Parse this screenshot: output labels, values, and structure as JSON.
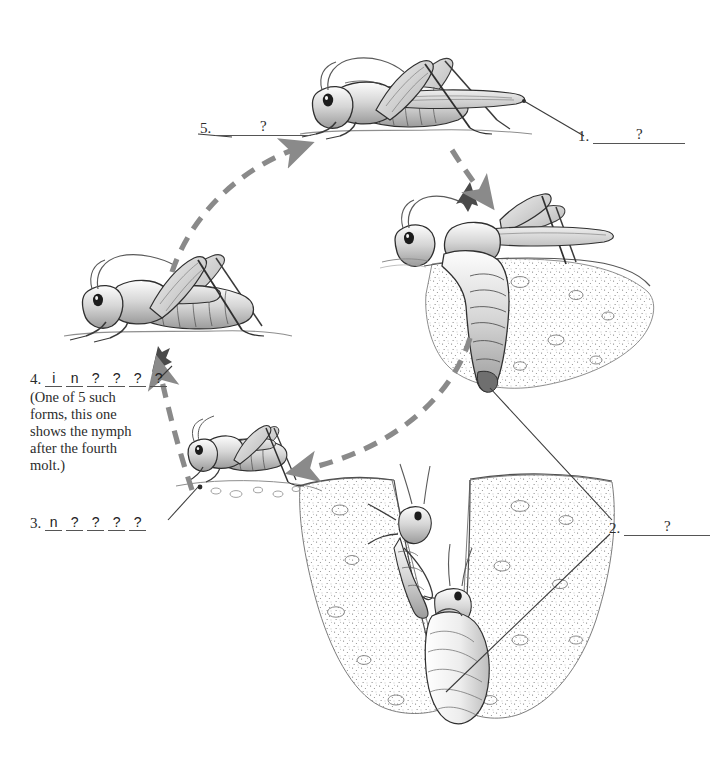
{
  "figure": {
    "background_color": "#ffffff",
    "ink_color": "#2b2b2b",
    "arrow_color": "#8a8a8a"
  },
  "labels": [
    {
      "id": "label-1",
      "number": "1.",
      "blank_type": "long",
      "answer_mark": "?",
      "note": ""
    },
    {
      "id": "label-2",
      "number": "2.",
      "blank_type": "long",
      "answer_mark": "?",
      "note": ""
    },
    {
      "id": "label-3",
      "number": "3.",
      "blank_type": "slots",
      "slots": [
        "n",
        "?",
        "?",
        "?",
        "?"
      ],
      "note": ""
    },
    {
      "id": "label-4",
      "number": "4.",
      "blank_type": "slots",
      "slots": [
        "i",
        "n",
        "?",
        "?",
        "?",
        "?"
      ],
      "note": "(One of 5 such\nforms, this one\nshows the nymph\nafter the fourth\nmolt.)"
    },
    {
      "id": "label-5",
      "number": "5.",
      "blank_type": "long",
      "answer_mark": "?",
      "note": ""
    }
  ],
  "stages": [
    {
      "id": "stage-adult",
      "name": "adult-grasshopper"
    },
    {
      "id": "stage-egg-laying",
      "name": "egg-laying-adult"
    },
    {
      "id": "stage-egg-pod",
      "name": "underground-egg-pod"
    },
    {
      "id": "stage-early-nymph",
      "name": "early-instar-nymph"
    },
    {
      "id": "stage-late-nymph",
      "name": "late-instar-nymph"
    }
  ],
  "arrows": [
    {
      "id": "arrow-adult-to-laying",
      "name": "adult-to-egg-laying-arrow"
    },
    {
      "id": "arrow-laying-to-nymph",
      "name": "eggs-to-nymph-arrow"
    },
    {
      "id": "arrow-nymph-to-latenymph",
      "name": "nymph-to-late-nymph-arrow"
    },
    {
      "id": "arrow-latenymph-to-adult",
      "name": "late-nymph-to-adult-arrow"
    }
  ]
}
